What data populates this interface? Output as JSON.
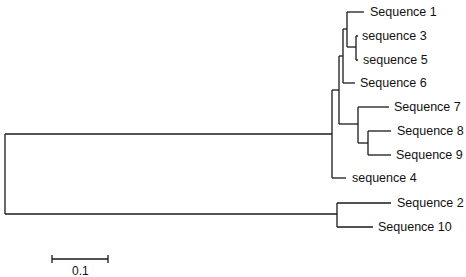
{
  "diagram": {
    "type": "phylogenetic-tree",
    "leaves": [
      {
        "id": "s1",
        "label": "Sequence 1",
        "x": 370,
        "y": 12
      },
      {
        "id": "s3",
        "label": "sequence 3",
        "x": 362,
        "y": 36
      },
      {
        "id": "s5",
        "label": "sequence 5",
        "x": 363,
        "y": 60
      },
      {
        "id": "s6",
        "label": "Sequence 6",
        "x": 360,
        "y": 83
      },
      {
        "id": "s7",
        "label": "Sequence 7",
        "x": 394,
        "y": 107
      },
      {
        "id": "s8",
        "label": "Sequence 8",
        "x": 397,
        "y": 131
      },
      {
        "id": "s9",
        "label": "Sequence 9",
        "x": 396,
        "y": 155
      },
      {
        "id": "s4",
        "label": "sequence 4",
        "x": 352,
        "y": 178
      },
      {
        "id": "s2",
        "label": "Sequence 2",
        "x": 397,
        "y": 203
      },
      {
        "id": "s10",
        "label": "Sequence 10",
        "x": 378,
        "y": 227
      }
    ],
    "topology": "((((((Sequence 1,(sequence 3,sequence 5)),Sequence 6),(Sequence 7,(Sequence 8,Sequence 9))),sequence 4),(Sequence 2,Sequence 10))",
    "scale_bar": {
      "label": "0.1",
      "x1": 52,
      "x2": 108,
      "y": 259
    }
  }
}
